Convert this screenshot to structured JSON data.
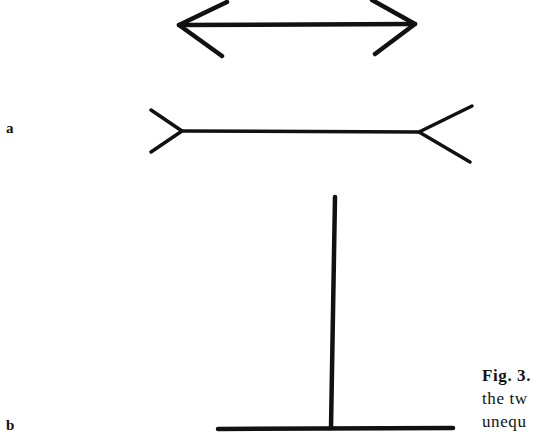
{
  "figure": {
    "panels": [
      {
        "label": "a",
        "description": "Müller-Lyer illusion: two horizontal shafts, upper with inward arrowheads, lower with outward fins"
      },
      {
        "label": "b",
        "description": "Vertical-horizontal illusion: inverted T with vertical line equal in length to horizontal line"
      }
    ],
    "caption": {
      "number": "Fig. 3.",
      "lines": [
        "the tw",
        "unequ"
      ]
    },
    "stroke_color": "#111111",
    "background_color": "#ffffff"
  }
}
